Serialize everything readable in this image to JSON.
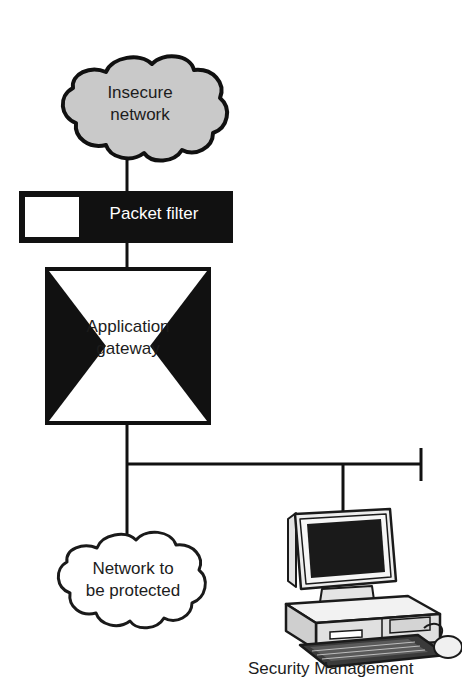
{
  "diagram": {
    "nodes": {
      "insecure_network": {
        "label": "Insecure\nnetwork",
        "shape": "cloud",
        "fill": "#c9c9c9",
        "stroke": "#101010"
      },
      "packet_filter": {
        "label": "Packet filter",
        "shape": "filled-bar-with-square",
        "fill": "#111111",
        "text_color": "#ffffff",
        "stroke": "#000000"
      },
      "application_gateway": {
        "label": "Application\ngateway",
        "shape": "box-with-inward-triangles",
        "fill": "#ffffff",
        "triangle_fill": "#111111",
        "stroke": "#111111"
      },
      "protected_network": {
        "label": "Network to\nbe protected",
        "shape": "cloud",
        "fill": "#ffffff",
        "stroke": "#1a1a1a"
      },
      "security_management": {
        "label": "Security Management",
        "shape": "desktop-computer",
        "screen_fill": "#1a1a1a",
        "case_fill": "#e8e8e8",
        "stroke": "#1a1a1a"
      }
    },
    "connections": [
      {
        "from": "insecure_network",
        "to": "packet_filter",
        "style": "vertical-line"
      },
      {
        "from": "packet_filter",
        "to": "application_gateway",
        "style": "vertical-line"
      },
      {
        "from": "application_gateway",
        "to": "network-bus",
        "style": "vertical-line"
      },
      {
        "from": "network-bus",
        "to": "protected_network",
        "style": "vertical-line"
      },
      {
        "from": "network-bus",
        "to": "security_management",
        "style": "vertical-drop"
      },
      {
        "from": "network-bus",
        "to": "bus-terminator",
        "style": "horizontal-bus-with-end-tick"
      }
    ]
  }
}
